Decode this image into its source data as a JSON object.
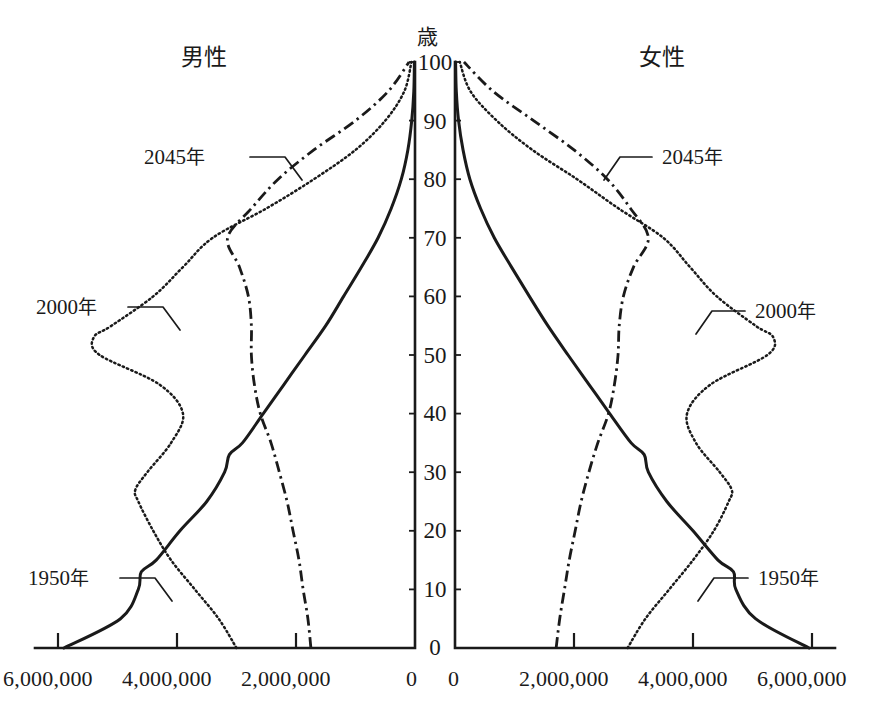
{
  "figure": {
    "age_axis_unit": "歳",
    "male_label": "男性",
    "female_label": "女性",
    "center_zero_left": "0",
    "center_zero_right": "0"
  },
  "age_ticks": [
    "0",
    "10",
    "20",
    "30",
    "40",
    "50",
    "60",
    "70",
    "80",
    "90",
    "100"
  ],
  "x_ticks_left": [
    "6,000,000",
    "4,000,000",
    "2,000,000",
    "0"
  ],
  "x_ticks_right": [
    "0",
    "2,000,000",
    "4,000,000",
    "6,000,000"
  ],
  "annotations": {
    "male_2045": {
      "year": "2045",
      "suffix": "年"
    },
    "male_2000": {
      "year": "2000",
      "suffix": "年"
    },
    "male_1950": {
      "year": "1950",
      "suffix": "年"
    },
    "female_2045": {
      "year": "2045",
      "suffix": "年"
    },
    "female_2000": {
      "year": "2000",
      "suffix": "年"
    },
    "female_1950": {
      "year": "1950",
      "suffix": "年"
    }
  },
  "colors": {
    "ink": "#1a1a1a",
    "paper": "#ffffff"
  },
  "chart_data": {
    "type": "line",
    "title": "",
    "subtitle": "",
    "xlabel": "",
    "ylabel": "歳",
    "orientation": "population-pyramid",
    "grid": false,
    "legend_position": "inline-annotations",
    "xlim_left": [
      6000000,
      0
    ],
    "xlim_right": [
      0,
      6000000
    ],
    "ylim": [
      0,
      100
    ],
    "x_tick_values": [
      0,
      2000000,
      4000000,
      6000000
    ],
    "y_tick_values": [
      0,
      10,
      20,
      30,
      40,
      50,
      60,
      70,
      80,
      90,
      100
    ],
    "series": [
      {
        "name": "1950 年",
        "style": "solid",
        "side": "male",
        "ages": [
          0,
          5,
          10,
          13,
          15,
          20,
          25,
          30,
          33,
          35,
          40,
          45,
          50,
          55,
          60,
          65,
          70,
          75,
          80,
          85,
          90,
          95,
          100
        ],
        "values": [
          5900000,
          4950000,
          4650000,
          4600000,
          4350000,
          3950000,
          3500000,
          3200000,
          3120000,
          2900000,
          2550000,
          2200000,
          1850000,
          1500000,
          1200000,
          900000,
          620000,
          400000,
          230000,
          120000,
          55000,
          20000,
          10000
        ]
      },
      {
        "name": "1950 年",
        "style": "solid",
        "side": "female",
        "ages": [
          0,
          5,
          10,
          13,
          15,
          20,
          25,
          30,
          33,
          35,
          40,
          45,
          50,
          55,
          60,
          65,
          70,
          75,
          80,
          85,
          90,
          95,
          100
        ],
        "values": [
          5950000,
          5050000,
          4720000,
          4680000,
          4420000,
          4000000,
          3560000,
          3250000,
          3180000,
          2960000,
          2600000,
          2250000,
          1900000,
          1560000,
          1250000,
          950000,
          660000,
          430000,
          250000,
          135000,
          60000,
          22000,
          10000
        ]
      },
      {
        "name": "2000 年",
        "style": "dotted",
        "side": "male",
        "ages": [
          0,
          5,
          10,
          15,
          20,
          25,
          27,
          30,
          35,
          40,
          45,
          50,
          53,
          55,
          60,
          65,
          70,
          75,
          80,
          85,
          90,
          95,
          100
        ],
        "values": [
          3000000,
          3300000,
          3700000,
          4100000,
          4400000,
          4650000,
          4700000,
          4500000,
          4100000,
          3900000,
          4300000,
          5300000,
          5400000,
          5100000,
          4400000,
          3900000,
          3400000,
          2500000,
          1700000,
          1000000,
          500000,
          180000,
          60000
        ]
      },
      {
        "name": "2000 年",
        "style": "dotted",
        "side": "female",
        "ages": [
          0,
          5,
          10,
          15,
          20,
          25,
          27,
          30,
          35,
          40,
          45,
          50,
          53,
          55,
          60,
          65,
          70,
          75,
          80,
          85,
          90,
          95,
          100
        ],
        "values": [
          2900000,
          3200000,
          3600000,
          4000000,
          4350000,
          4600000,
          4650000,
          4450000,
          4050000,
          3900000,
          4300000,
          5250000,
          5350000,
          5050000,
          4400000,
          3950000,
          3500000,
          2750000,
          2050000,
          1300000,
          700000,
          260000,
          80000
        ]
      },
      {
        "name": "2045 年",
        "style": "dash-dot",
        "side": "male",
        "ages": [
          0,
          5,
          10,
          15,
          20,
          25,
          30,
          35,
          40,
          45,
          50,
          55,
          60,
          65,
          70,
          75,
          80,
          85,
          90,
          95,
          100
        ],
        "values": [
          1750000,
          1800000,
          1880000,
          1950000,
          2050000,
          2150000,
          2280000,
          2420000,
          2600000,
          2700000,
          2750000,
          2750000,
          2800000,
          2950000,
          3150000,
          2750000,
          2300000,
          1700000,
          1000000,
          450000,
          100000
        ]
      },
      {
        "name": "2045 年",
        "style": "dash-dot",
        "side": "female",
        "ages": [
          0,
          5,
          10,
          15,
          20,
          25,
          30,
          35,
          40,
          45,
          50,
          55,
          60,
          65,
          70,
          75,
          80,
          85,
          90,
          95,
          100
        ],
        "values": [
          1700000,
          1760000,
          1840000,
          1920000,
          2020000,
          2120000,
          2250000,
          2400000,
          2580000,
          2680000,
          2740000,
          2760000,
          2830000,
          3000000,
          3250000,
          2950000,
          2560000,
          2000000,
          1320000,
          640000,
          150000
        ]
      }
    ]
  }
}
